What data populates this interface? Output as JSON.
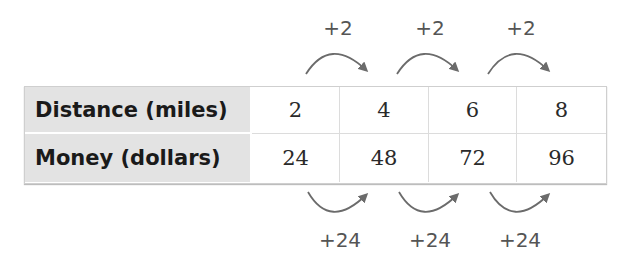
{
  "table": {
    "rows": [
      {
        "header": "Distance (miles)",
        "values": [
          "2",
          "4",
          "6",
          "8"
        ]
      },
      {
        "header": "Money (dollars)",
        "values": [
          "24",
          "48",
          "72",
          "96"
        ]
      }
    ]
  },
  "annotations": {
    "top": [
      {
        "label": "+2",
        "from_col": 1,
        "to_col": 2
      },
      {
        "label": "+2",
        "from_col": 2,
        "to_col": 3
      },
      {
        "label": "+2",
        "from_col": 3,
        "to_col": 4
      }
    ],
    "bottom": [
      {
        "label": "+24",
        "from_col": 1,
        "to_col": 2
      },
      {
        "label": "+24",
        "from_col": 2,
        "to_col": 3
      },
      {
        "label": "+24",
        "from_col": 3,
        "to_col": 4
      }
    ]
  },
  "colors": {
    "header_bg": "#e3e3e3",
    "arrow": "#6b6b6b",
    "label": "#555555"
  }
}
